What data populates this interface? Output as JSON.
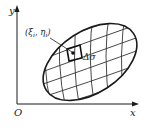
{
  "diagram": {
    "axes": {
      "x_label": "x",
      "y_label": "y",
      "origin_label": "O"
    },
    "point_label": "(ξi, ηi)",
    "point_label_parts": {
      "open": "(",
      "xi": "ξ",
      "xi_sub": "i",
      "sep": ", ",
      "eta": "η",
      "eta_sub": "i",
      "close": ")"
    },
    "cell_label": "Δσ",
    "colors": {
      "stroke": "#1a1a1a",
      "grid": "#333333"
    }
  }
}
